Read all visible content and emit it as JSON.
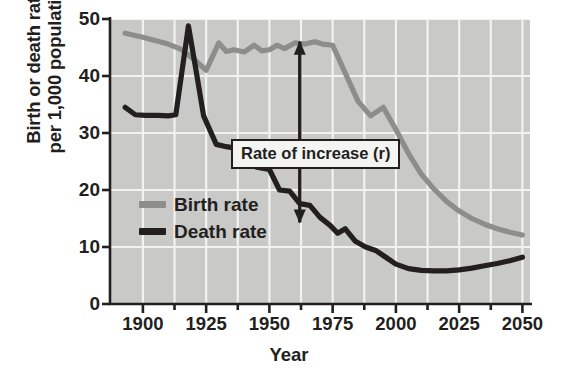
{
  "chart_data": {
    "type": "line",
    "title": "",
    "xlabel": "Year",
    "ylabel": "Birth or death rate\nper 1,000 population",
    "xlim": [
      1887,
      2053
    ],
    "ylim": [
      0,
      50
    ],
    "xticks": [
      1900,
      1925,
      1950,
      1975,
      2000,
      2025,
      2050
    ],
    "xticklabels": [
      "1900",
      "1925",
      "1950",
      "1975",
      "2000",
      "2025",
      "2050"
    ],
    "yticks": [
      0,
      10,
      20,
      30,
      40,
      50
    ],
    "yticklabels": [
      "0",
      "10",
      "20",
      "30",
      "40",
      "50"
    ],
    "grid": true,
    "grid_color": "#f2f2f0",
    "plot_bg": "#c9c9c7",
    "legend_position": "inner-left",
    "series": [
      {
        "name": "Birth rate",
        "color": "#8d8d8b",
        "x": [
          1893,
          1900,
          1910,
          1915,
          1920,
          1925,
          1930,
          1933,
          1936,
          1940,
          1944,
          1947,
          1950,
          1953,
          1956,
          1960,
          1964,
          1968,
          1971,
          1975,
          1980,
          1985,
          1990,
          1995,
          2000,
          2005,
          2010,
          2015,
          2020,
          2025,
          2030,
          2035,
          2040,
          2045,
          2050
        ],
        "values": [
          47.5,
          46.8,
          45.6,
          44.7,
          43.0,
          41.0,
          45.8,
          44.3,
          44.6,
          44.2,
          45.4,
          44.4,
          44.6,
          45.4,
          44.8,
          45.8,
          45.6,
          46.0,
          45.6,
          45.4,
          40.5,
          35.6,
          33.0,
          34.5,
          30.6,
          26.4,
          22.8,
          20.2,
          18.0,
          16.3,
          15.0,
          14.0,
          13.2,
          12.6,
          12.1
        ]
      },
      {
        "name": "Death rate",
        "color": "#231f20",
        "x": [
          1893,
          1897,
          1901,
          1906,
          1910,
          1913,
          1918,
          1921,
          1924,
          1929,
          1933,
          1937,
          1941,
          1945,
          1950,
          1954,
          1958,
          1962,
          1966,
          1970,
          1974,
          1977,
          1980,
          1984,
          1988,
          1992,
          1996,
          2000,
          2005,
          2010,
          2015,
          2020,
          2025,
          2030,
          2035,
          2040,
          2045,
          2050
        ],
        "values": [
          34.5,
          33.2,
          33.1,
          33.1,
          33.0,
          33.2,
          48.8,
          41.0,
          33.0,
          28.0,
          27.6,
          27.3,
          25.0,
          24.0,
          23.6,
          20.0,
          19.8,
          17.6,
          17.3,
          15.2,
          13.8,
          12.4,
          13.2,
          11.0,
          10.0,
          9.4,
          8.2,
          7.0,
          6.2,
          5.9,
          5.8,
          5.8,
          6.0,
          6.3,
          6.7,
          7.1,
          7.6,
          8.2
        ]
      }
    ],
    "annotations": [
      {
        "name": "rate-of-increase-callout",
        "text": "Rate  of increase (r)",
        "arrow_x": 1962,
        "arrow_top_value": 46.0,
        "arrow_bottom_value": 14.3
      }
    ]
  },
  "legend": {
    "items": [
      {
        "label": "Birth rate",
        "color": "#8d8d8b"
      },
      {
        "label": "Death rate",
        "color": "#231f20"
      }
    ]
  }
}
